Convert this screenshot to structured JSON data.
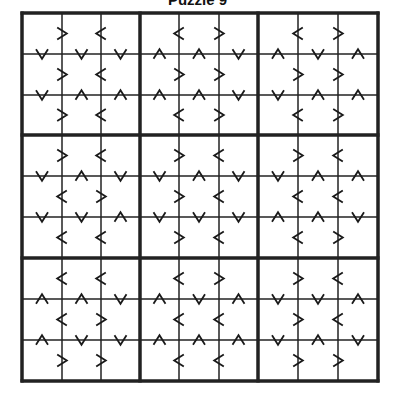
{
  "title": "Puzzle 9",
  "puzzle_type": "greater-than-sudoku",
  "grid": {
    "rows": 9,
    "cols": 9,
    "box_size": 3,
    "x_lines": [
      22,
      62,
      101,
      140,
      179,
      219,
      258,
      298,
      338,
      378
    ],
    "y_lines": [
      13,
      54,
      95,
      135,
      176,
      217,
      258,
      299,
      340,
      381
    ],
    "line_color": "#222222",
    "thin_width": 1.5,
    "thick_width": 3.5
  },
  "horizontal_constraints": [
    [
      ">",
      "<",
      "<",
      ">",
      "<",
      ">"
    ],
    [
      ">",
      "<",
      ">",
      ">",
      ">",
      ">"
    ],
    [
      ">",
      "<",
      "<",
      ">",
      "<",
      ">"
    ],
    [
      ">",
      "<",
      ">",
      "<",
      ">",
      "<"
    ],
    [
      "<",
      ">",
      ">",
      "<",
      "<",
      "<"
    ],
    [
      "<",
      "<",
      ">",
      "<",
      "<",
      ">"
    ],
    [
      "<",
      "<",
      "<",
      ">",
      ">",
      "<"
    ],
    [
      "<",
      ">",
      "<",
      "<",
      ">",
      "<"
    ],
    [
      ">",
      ">",
      "<",
      "<",
      ">",
      ">"
    ]
  ],
  "vertical_constraints": [
    [
      "v",
      "v",
      "v",
      "^",
      "^",
      "v",
      "^",
      "v",
      "^"
    ],
    [
      "v",
      "^",
      "^",
      "^",
      "^",
      "v",
      "v",
      "^",
      "^"
    ],
    [
      "v",
      "^",
      "v",
      "v",
      "^",
      "v",
      "v",
      "^",
      "^"
    ],
    [
      "v",
      "v",
      "^",
      "v",
      "v",
      "v",
      "^",
      "^",
      "v"
    ],
    [
      "^",
      "^",
      "v",
      "^",
      "v",
      "^",
      "v",
      "v",
      "^"
    ],
    [
      "^",
      "v",
      "v",
      "^",
      "^",
      "^",
      "v",
      "^",
      "v"
    ]
  ],
  "constraint_notes": {
    "horizontal_layout": "per row: 6 symbols = within each 3-col box, between col0-col1 and col1-col2 (3 boxes x 2)",
    "vertical_layout": "6 bands = within each 3-row box, between row0-row1 and row1-row2 (3 boxes x 2); 9 symbols per band"
  }
}
